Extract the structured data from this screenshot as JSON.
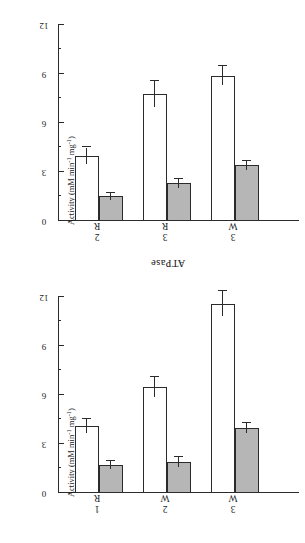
{
  "figure": {
    "orientation_note": "upside-down",
    "axis_title": "Activity (mM min⁻¹ mg⁻¹)",
    "axis_title_main": "Activity (mM min",
    "axis_title_sup1": "-1",
    "axis_title_mid": " mg",
    "axis_title_sup2": "-1",
    "axis_title_end": ")",
    "bar_fill_color": "#b6b6b6",
    "bar_line_color": "#2b2b2b",
    "open_bar_color": "#ffffff"
  },
  "chart_data": [
    {
      "type": "bar",
      "title": "ATPase",
      "panel_id": "atpase",
      "xlabel": "",
      "ylabel": "Activity (mM min-1 mg-1)",
      "ylim": [
        0,
        12
      ],
      "yticks": [
        0,
        3,
        6,
        9,
        12
      ],
      "ytick_labels": [
        "0",
        "3",
        "6",
        "9",
        "12"
      ],
      "minor_ticks": [
        1.5,
        4.5,
        7.5,
        10.5
      ],
      "grid": false,
      "legend": "none",
      "categories": [
        "R 1",
        "W 2",
        "W 3"
      ],
      "category_letters": [
        "R",
        "W",
        "W"
      ],
      "category_numbers": [
        "1",
        "2",
        "3"
      ],
      "series": [
        {
          "name": "filled",
          "values": [
            1.7,
            1.9,
            4.0
          ],
          "errors": [
            0.25,
            0.3,
            0.3
          ]
        },
        {
          "name": "open",
          "values": [
            4.1,
            6.5,
            11.6
          ],
          "errors": [
            0.45,
            0.6,
            0.75
          ]
        }
      ]
    },
    {
      "type": "bar",
      "title": "LDH",
      "panel_id": "ldh",
      "xlabel": "",
      "ylabel": "Activity (mM min-1 mg-1)",
      "ylim": [
        0,
        12
      ],
      "yticks": [
        0,
        3,
        6,
        9,
        12
      ],
      "ytick_labels": [
        "0",
        "3",
        "6",
        "9",
        "12"
      ],
      "minor_ticks": [
        1.5,
        4.5,
        7.5,
        10.5
      ],
      "grid": false,
      "legend": "none",
      "categories": [
        "R 2",
        "R 3",
        "W 3"
      ],
      "category_letters": [
        "R",
        "R",
        "W"
      ],
      "category_numbers": [
        "2",
        "3",
        "3"
      ],
      "series": [
        {
          "name": "filled",
          "values": [
            1.5,
            2.3,
            3.4
          ],
          "errors": [
            0.2,
            0.3,
            0.3
          ]
        },
        {
          "name": "open",
          "values": [
            4.0,
            7.8,
            8.9
          ],
          "errors": [
            0.5,
            0.8,
            0.6
          ]
        }
      ]
    }
  ]
}
